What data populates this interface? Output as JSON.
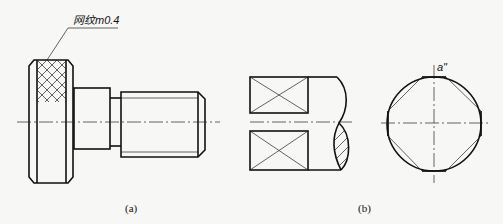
{
  "figure": {
    "knurl_note": "网纹m0.4",
    "caption_a": "(a)",
    "caption_b": "(b)",
    "view_label": "a\""
  }
}
